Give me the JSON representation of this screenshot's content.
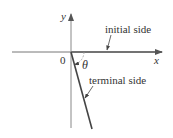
{
  "diagram": {
    "labels": {
      "y_axis": "y",
      "x_axis": "x",
      "origin": "0",
      "angle": "θ",
      "initial_side": "initial side",
      "terminal_side": "terminal side"
    },
    "colors": {
      "axis": "#777777",
      "side": "#444444",
      "text": "#333333"
    }
  }
}
